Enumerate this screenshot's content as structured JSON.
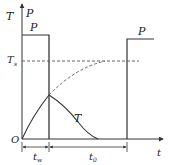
{
  "diagram": {
    "axes": {
      "y_label_1": "T",
      "y_label_2": "P",
      "x_label": "t",
      "origin_label": "O"
    },
    "labels": {
      "pulse_1": "P",
      "pulse_2": "P",
      "steady_temp": "T",
      "steady_temp_sub": "s",
      "temp_curve": "T",
      "work_time": "t",
      "work_time_sub": "w",
      "rest_time": "t",
      "rest_time_sub": "0"
    },
    "colors": {
      "line": "#333333",
      "dash": "#555555",
      "background": "#ffffff"
    }
  }
}
